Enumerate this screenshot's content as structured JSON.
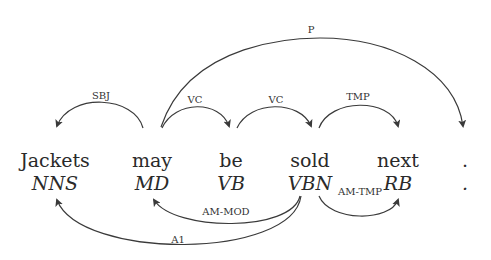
{
  "tokens": [
    {
      "word": "Jackets",
      "tag": "NNS"
    },
    {
      "word": "may",
      "tag": "MD"
    },
    {
      "word": "be",
      "tag": "VB"
    },
    {
      "word": "sold",
      "tag": "VBN"
    },
    {
      "word": "next",
      "tag": "RB"
    },
    {
      "word": ".",
      "tag": "."
    }
  ],
  "syntactic_arcs": [
    {
      "label": "SBJ",
      "head": "may",
      "dependent": "Jackets"
    },
    {
      "label": "VC",
      "head": "may",
      "dependent": "be"
    },
    {
      "label": "VC",
      "head": "be",
      "dependent": "sold"
    },
    {
      "label": "TMP",
      "head": "sold",
      "dependent": "next"
    },
    {
      "label": "P",
      "head": "may",
      "dependent": "."
    }
  ],
  "semantic_arcs": [
    {
      "label": "AM-MOD",
      "head": "sold",
      "dependent": "may"
    },
    {
      "label": "A1",
      "head": "sold",
      "dependent": "Jackets"
    },
    {
      "label": "AM-TMP",
      "head": "sold",
      "dependent": "next"
    }
  ],
  "colors": {
    "ink": "#2a2a2a",
    "background": "#ffffff"
  }
}
